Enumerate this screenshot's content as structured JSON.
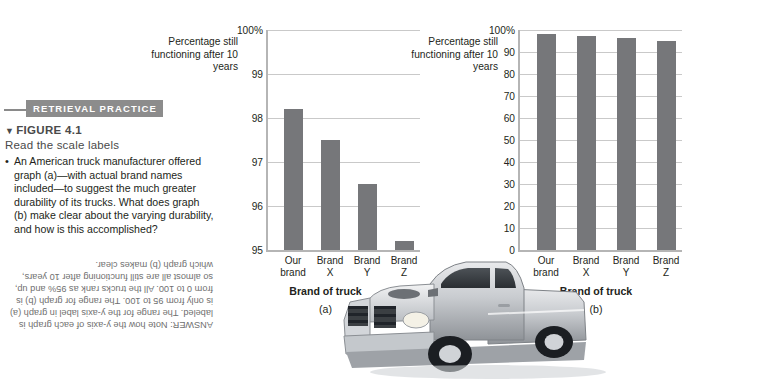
{
  "figure": {
    "banner_label": "RETRIEVAL PRACTICE",
    "triangle": "▼",
    "number_label": "FIGURE 4.1",
    "subtitle": "Read the scale labels",
    "bullet": "•",
    "question": "An American truck manufacturer offered graph (a)—with actual brand names included—to suggest the much greater durability of its trucks. What does graph (b) make clear about the varying durability, and how is this accomplished?",
    "answer": "ANSWER: Note how the y-axis of each graph is labeled. The range for the y-axis label in graph (a) is only from 95 to 100. The range for graph (b) is from 0 to 100. All the trucks rank as 95% and up, so almost all are still functioning after 10 years, which graph (b) makes clear."
  },
  "photo": {
    "caption": "silver pickup truck"
  },
  "chart_data": [
    {
      "type": "bar",
      "panel": "(a)",
      "title": "",
      "ylabel": "Percentage still functioning after 10 years",
      "xlabel": "Brand of truck",
      "categories": [
        "Our brand",
        "Brand X",
        "Brand Y",
        "Brand Z"
      ],
      "category_lines": [
        [
          "Our",
          "brand"
        ],
        [
          "Brand",
          "X"
        ],
        [
          "Brand",
          "Y"
        ],
        [
          "Brand",
          "Z"
        ]
      ],
      "values": [
        98.2,
        97.5,
        96.5,
        95.2
      ],
      "ylim": [
        95,
        100
      ],
      "yticks": [
        95,
        96,
        97,
        98,
        99,
        100
      ],
      "ytick_labels": [
        "95",
        "96",
        "97",
        "98",
        "99",
        "100%"
      ],
      "grid": true,
      "legend": "none",
      "bar_color": "#76777a"
    },
    {
      "type": "bar",
      "panel": "(b)",
      "title": "",
      "ylabel": "Percentage still functioning after 10 years",
      "xlabel": "Brand of truck",
      "categories": [
        "Our brand",
        "Brand X",
        "Brand Y",
        "Brand Z"
      ],
      "category_lines": [
        [
          "Our",
          "brand"
        ],
        [
          "Brand",
          "X"
        ],
        [
          "Brand",
          "Y"
        ],
        [
          "Brand",
          "Z"
        ]
      ],
      "values": [
        98.2,
        97.5,
        96.5,
        95.2
      ],
      "ylim": [
        0,
        100
      ],
      "yticks": [
        0,
        10,
        20,
        30,
        40,
        50,
        60,
        70,
        80,
        90,
        100
      ],
      "ytick_labels": [
        "0",
        "10",
        "20",
        "30",
        "40",
        "50",
        "60",
        "70",
        "80",
        "90",
        "100%"
      ],
      "grid": true,
      "legend": "none",
      "bar_color": "#76777a"
    }
  ]
}
